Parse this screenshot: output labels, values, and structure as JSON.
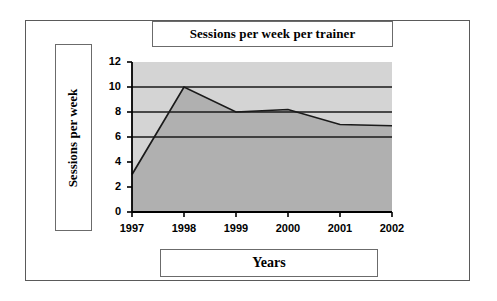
{
  "page": {
    "background_color": "#ffffff",
    "frame_color": "#5a5a5a"
  },
  "chart_data": {
    "type": "area",
    "title": "Sessions per week per trainer",
    "xlabel": "Years",
    "ylabel": "Sessions per week",
    "categories": [
      "1997",
      "1998",
      "1999",
      "2000",
      "2001",
      "2002"
    ],
    "values": [
      3,
      10,
      8,
      8.2,
      7,
      6.9
    ],
    "series": [
      {
        "name": "Sessions per week per trainer",
        "values": [
          3,
          10,
          8,
          8.2,
          7,
          6.9
        ]
      }
    ],
    "ylim": [
      0,
      12
    ],
    "ytick_labels": [
      "0",
      "2",
      "4",
      "6",
      "8",
      "10",
      "12"
    ],
    "ytick_values": [
      0,
      2,
      4,
      6,
      8,
      10,
      12
    ],
    "xtick_labels": [
      "1997",
      "1998",
      "1999",
      "2000",
      "2001",
      "2002"
    ],
    "gridlines": [
      6,
      8,
      10
    ],
    "grid": true,
    "legend": "none",
    "colors": {
      "plot_background": "#d4d4d4",
      "area_fill": "#b0b0b0",
      "line": "#1a1a1a",
      "axis": "#000000",
      "gridline": "#1a1a1a"
    }
  }
}
